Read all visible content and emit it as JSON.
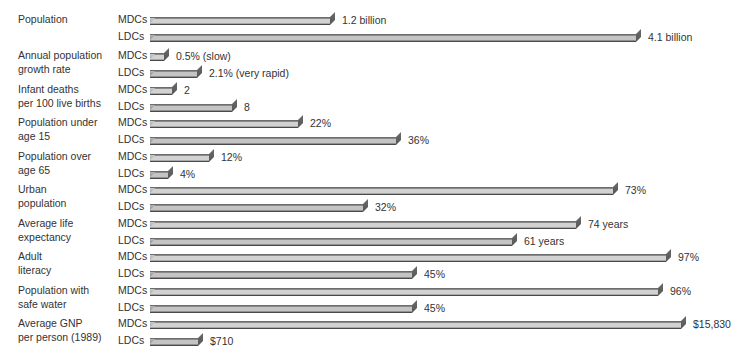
{
  "chart_data": {
    "type": "bar",
    "title": "",
    "subtitle": "",
    "xlabel": "",
    "ylabel": "",
    "orientation": "horizontal",
    "grid": false,
    "legend_position": "none",
    "group_labels": [
      "MDCs",
      "LDCs"
    ],
    "categories": [
      "Population",
      "Annual population growth rate",
      "Infant deaths per 100 live births",
      "Population under age 15",
      "Population over age 65",
      "Urban population",
      "Average life expectancy",
      "Adult literacy",
      "Population with safe water",
      "Average GNP per person (1989)"
    ],
    "series": [
      {
        "name": "MDCs",
        "values": [
          1.2,
          0.5,
          2,
          22,
          12,
          73,
          74,
          97,
          96,
          15830
        ],
        "labels": [
          "1.2 billion",
          "0.5% (slow)",
          "2",
          "22%",
          "12%",
          "73%",
          "74 years",
          "97%",
          "96%",
          "$15,830"
        ]
      },
      {
        "name": "LDCs",
        "values": [
          4.1,
          2.1,
          8,
          36,
          4,
          32,
          61,
          45,
          45,
          710
        ],
        "labels": [
          "4.1 billion",
          "2.1% (very rapid)",
          "8",
          "36%",
          "4%",
          "32%",
          "61 years",
          "45%",
          "45%",
          "$710"
        ]
      }
    ]
  },
  "rows": [
    {
      "label_lines": [
        "Population"
      ],
      "top": 8,
      "bars": [
        {
          "group": "MDCs",
          "value_label": "1.2 billion",
          "width": 180,
          "shade": "light"
        },
        {
          "group": "LDCs",
          "value_label": "4.1 billion",
          "width": 486,
          "shade": "dark"
        }
      ]
    },
    {
      "label_lines": [
        "Annual population",
        "growth rate"
      ],
      "top": 48,
      "bars": [
        {
          "group": "MDCs",
          "value_label": "0.5% (slow)",
          "width": 14,
          "shade": "light"
        },
        {
          "group": "LDCs",
          "value_label": "2.1% (very rapid)",
          "width": 47,
          "shade": "dark"
        }
      ]
    },
    {
      "label_lines": [
        "Infant deaths",
        "per 100 live births"
      ],
      "top": 85,
      "bars": [
        {
          "group": "MDCs",
          "value_label": "2",
          "width": 22,
          "shade": "light"
        },
        {
          "group": "LDCs",
          "value_label": "8",
          "width": 82,
          "shade": "dark"
        }
      ]
    },
    {
      "label_lines": [
        "Population under",
        "age 15"
      ],
      "top": 122,
      "bars": [
        {
          "group": "MDCs",
          "value_label": "22%",
          "width": 148,
          "shade": "light"
        },
        {
          "group": "LDCs",
          "value_label": "36%",
          "width": 246,
          "shade": "dark"
        }
      ]
    },
    {
      "label_lines": [
        "Population over",
        "age 65"
      ],
      "top": 159,
      "bars": [
        {
          "group": "MDCs",
          "value_label": "12%",
          "width": 59,
          "shade": "light"
        },
        {
          "group": "LDCs",
          "value_label": "4%",
          "width": 18,
          "shade": "dark"
        }
      ]
    },
    {
      "label_lines": [
        "Urban",
        "population"
      ],
      "top": 196,
      "bars": [
        {
          "group": "MDCs",
          "value_label": "73%",
          "width": 463,
          "shade": "light"
        },
        {
          "group": "LDCs",
          "value_label": "32%",
          "width": 213,
          "shade": "dark"
        }
      ]
    },
    {
      "label_lines": [
        "Average life",
        "expectancy"
      ],
      "top": 233,
      "bars": [
        {
          "group": "MDCs",
          "value_label": "74 years",
          "width": 426,
          "shade": "light"
        },
        {
          "group": "LDCs",
          "value_label": "61 years",
          "width": 362,
          "shade": "dark"
        }
      ]
    },
    {
      "label_lines": [
        "Adult",
        "literacy"
      ],
      "top": 270,
      "bars": [
        {
          "group": "MDCs",
          "value_label": "97%",
          "width": 516,
          "shade": "light"
        },
        {
          "group": "LDCs",
          "value_label": "45%",
          "width": 262,
          "shade": "dark"
        }
      ]
    },
    {
      "label_lines": [
        "Population with",
        "safe water"
      ],
      "top": 307,
      "bars": [
        {
          "group": "MDCs",
          "value_label": "96%",
          "width": 508,
          "shade": "light"
        },
        {
          "group": "LDCs",
          "value_label": "45%",
          "width": 262,
          "shade": "dark"
        }
      ]
    },
    {
      "label_lines": [
        "Average GNP",
        "per person (1989)"
      ],
      "top": 344,
      "bars": [
        {
          "group": "MDCs",
          "value_label": "$15,830",
          "width": 531,
          "shade": "light"
        },
        {
          "group": "LDCs",
          "value_label": "$710",
          "width": 48,
          "shade": "dark"
        }
      ]
    }
  ],
  "colors": {
    "background": "#ffffff",
    "text": "#333333",
    "bar_light": "#c0c0c0",
    "bar_dark": "#9a9a9a",
    "bar_edge": "#565656"
  }
}
